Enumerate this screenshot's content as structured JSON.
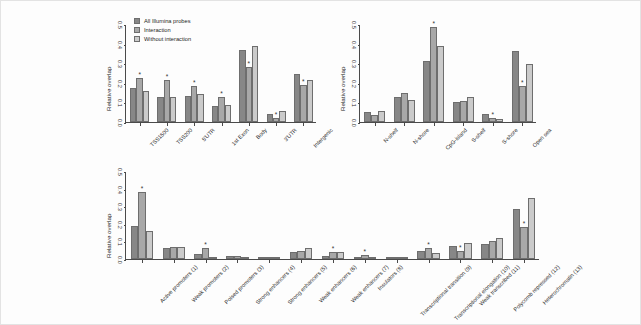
{
  "figure": {
    "background": "#fdfdfd",
    "series_colors": [
      "#878787",
      "#a8a8a8",
      "#cbcbcb"
    ]
  },
  "legend": {
    "position": "top-left-panel-a",
    "items": [
      {
        "label": "All Illumina probes",
        "color": "#878787"
      },
      {
        "label": "Interaction",
        "color": "#a8a8a8"
      },
      {
        "label": "Without interaction",
        "color": "#cbcbcb"
      }
    ]
  },
  "chart_data": [
    {
      "id": "panel-a",
      "type": "bar",
      "title": "",
      "xlabel": "",
      "ylabel": "Relative overlap",
      "ylim": [
        0,
        0.5
      ],
      "yticks": [
        "0.0",
        "0.1",
        "0.2",
        "0.3",
        "0.4",
        "0.5"
      ],
      "grid": false,
      "legend_position": "top-left",
      "categories": [
        "TSS1500",
        "TSS200",
        "5'UTR",
        "1st Exon",
        "Body",
        "3'UTR",
        "Intergenic"
      ],
      "series": [
        {
          "name": "All Illumina probes",
          "values": [
            0.175,
            0.128,
            0.133,
            0.081,
            0.365,
            0.041,
            0.245
          ]
        },
        {
          "name": "Interaction",
          "values": [
            0.226,
            0.216,
            0.185,
            0.128,
            0.281,
            0.021,
            0.19
          ]
        },
        {
          "name": "Without interaction",
          "values": [
            0.158,
            0.13,
            0.143,
            0.087,
            0.386,
            0.057,
            0.212
          ]
        }
      ],
      "significance": [
        {
          "category": "TSS1500",
          "marker": "*"
        },
        {
          "category": "TSS200",
          "marker": "*"
        },
        {
          "category": "5'UTR",
          "marker": "*"
        },
        {
          "category": "1st Exon",
          "marker": "*"
        },
        {
          "category": "Body",
          "marker": "*"
        },
        {
          "category": "3'UTR",
          "marker": "*"
        },
        {
          "category": "Intergenic",
          "marker": "*"
        }
      ]
    },
    {
      "id": "panel-b",
      "type": "bar",
      "title": "",
      "xlabel": "",
      "ylabel": "Relative overlap",
      "ylim": [
        0,
        0.5
      ],
      "yticks": [
        "0.0",
        "0.1",
        "0.2",
        "0.3",
        "0.4",
        "0.5"
      ],
      "grid": false,
      "legend_position": "none",
      "categories": [
        "N-shelf",
        "N-shore",
        "CpG-island",
        "S-shelf",
        "S-shore",
        "Open sea"
      ],
      "series": [
        {
          "name": "All Illumina probes",
          "values": [
            0.05,
            0.128,
            0.31,
            0.101,
            0.043,
            0.36
          ]
        },
        {
          "name": "Interaction",
          "values": [
            0.034,
            0.15,
            0.487,
            0.108,
            0.022,
            0.182
          ]
        },
        {
          "name": "Without interaction",
          "values": [
            0.056,
            0.112,
            0.386,
            0.126,
            0.014,
            0.298
          ]
        }
      ],
      "significance": [
        {
          "category": "CpG-island",
          "marker": "*"
        },
        {
          "category": "S-shore",
          "marker": "*"
        },
        {
          "category": "Open sea",
          "marker": "*"
        }
      ]
    },
    {
      "id": "panel-c",
      "type": "bar",
      "title": "",
      "xlabel": "",
      "ylabel": "Relative overlap",
      "ylim": [
        0,
        0.5
      ],
      "yticks": [
        "0.0",
        "0.1",
        "0.2",
        "0.3",
        "0.4",
        "0.5"
      ],
      "grid": false,
      "legend_position": "none",
      "categories": [
        "Active promoters (1)",
        "Weak promoters (2)",
        "Poised promoters (3)",
        "Strong enhancers (4)",
        "Strong enhancers (5)",
        "Weak enhancers (6)",
        "Weak enhancers (7)",
        "Insulators (8)",
        "Transcriptional transition (9)",
        "Transcriptional elongation (10)",
        "Weak transcribed (11)",
        "Polycomb repressed (12)",
        "Heterochromatin (13)"
      ],
      "series": [
        {
          "name": "All Illumina probes",
          "values": [
            0.188,
            0.064,
            0.03,
            0.018,
            0.004,
            0.042,
            0.016,
            0.008,
            0.005,
            0.044,
            0.076,
            0.086,
            0.285
          ]
        },
        {
          "name": "Interaction",
          "values": [
            0.378,
            0.07,
            0.062,
            0.016,
            0.002,
            0.044,
            0.038,
            0.022,
            0.006,
            0.062,
            0.046,
            0.1,
            0.18
          ]
        },
        {
          "name": "Without interaction",
          "values": [
            0.162,
            0.066,
            0.006,
            0.002,
            0.001,
            0.062,
            0.04,
            0.004,
            0.003,
            0.032,
            0.092,
            0.118,
            0.345
          ]
        }
      ],
      "significance": [
        {
          "category": "Active promoters (1)",
          "marker": "*"
        },
        {
          "category": "Poised promoters (3)",
          "marker": "*"
        },
        {
          "category": "Weak enhancers (7)",
          "marker": "*"
        },
        {
          "category": "Insulators (8)",
          "marker": "*"
        },
        {
          "category": "Transcriptional elongation (10)",
          "marker": "*"
        },
        {
          "category": "Weak transcribed (11)",
          "marker": "*"
        },
        {
          "category": "Heterochromatin (13)",
          "marker": "*"
        }
      ]
    }
  ]
}
